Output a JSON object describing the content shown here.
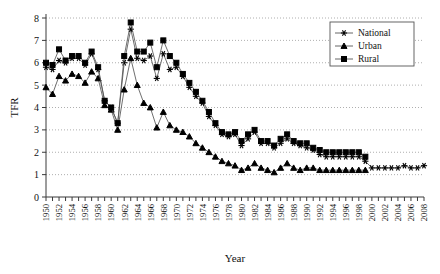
{
  "chart_data": {
    "type": "line",
    "title": "",
    "xlabel": "Year",
    "ylabel": "TFR",
    "xlim": [
      1950,
      2008
    ],
    "ylim": [
      0,
      8
    ],
    "yticks": [
      0,
      1,
      2,
      3,
      4,
      5,
      6,
      7,
      8
    ],
    "xtick_labels": [
      "1950",
      "1952",
      "1954",
      "1956",
      "1958",
      "1960",
      "1962",
      "1964",
      "1966",
      "1968",
      "1970",
      "1972",
      "1974",
      "1976",
      "1978",
      "1980",
      "1982",
      "1984",
      "1986",
      "1988",
      "1990",
      "1992",
      "1994",
      "1996",
      "1998",
      "2000",
      "2002",
      "2004",
      "2006",
      "2008"
    ],
    "xtick_step": 2,
    "grid": "horizontal-dotted",
    "legend_position": "top-right",
    "legend": [
      "National",
      "Urban",
      "Rural"
    ],
    "markers": {
      "National": "asterisk",
      "Urban": "triangle",
      "Rural": "square"
    },
    "series": [
      {
        "name": "National",
        "marker": "asterisk",
        "x": [
          1950,
          1951,
          1952,
          1953,
          1954,
          1955,
          1956,
          1957,
          1958,
          1959,
          1960,
          1961,
          1962,
          1963,
          1964,
          1965,
          1966,
          1967,
          1968,
          1969,
          1970,
          1971,
          1972,
          1973,
          1974,
          1975,
          1976,
          1977,
          1978,
          1979,
          1980,
          1981,
          1982,
          1983,
          1984,
          1985,
          1986,
          1987,
          1988,
          1989,
          1990,
          1991,
          1992,
          1993,
          1994,
          1995,
          1996,
          1997,
          1998,
          1999,
          2000,
          2001,
          2002,
          2003,
          2004,
          2005,
          2006,
          2007,
          2008
        ],
        "values": [
          5.8,
          5.7,
          6.1,
          6.0,
          6.2,
          6.2,
          5.9,
          6.4,
          5.7,
          4.3,
          4.0,
          3.3,
          6.0,
          7.5,
          6.2,
          6.1,
          6.3,
          5.3,
          6.4,
          5.7,
          5.8,
          5.4,
          4.9,
          4.5,
          4.2,
          3.6,
          3.2,
          2.8,
          2.7,
          2.8,
          2.3,
          2.6,
          2.9,
          2.4,
          2.4,
          2.2,
          2.4,
          2.6,
          2.4,
          2.3,
          2.2,
          2.1,
          1.9,
          1.8,
          1.8,
          1.8,
          1.8,
          1.8,
          1.8,
          1.6,
          1.3,
          1.3,
          1.3,
          1.3,
          1.3,
          1.4,
          1.3,
          1.3,
          1.4
        ]
      },
      {
        "name": "Urban",
        "marker": "triangle",
        "x": [
          1950,
          1951,
          1952,
          1953,
          1954,
          1955,
          1956,
          1957,
          1958,
          1959,
          1960,
          1961,
          1962,
          1963,
          1964,
          1965,
          1966,
          1967,
          1968,
          1969,
          1970,
          1971,
          1972,
          1973,
          1974,
          1975,
          1976,
          1977,
          1978,
          1979,
          1980,
          1981,
          1982,
          1983,
          1984,
          1985,
          1986,
          1987,
          1988,
          1989,
          1990,
          1991,
          1992,
          1993,
          1994,
          1995,
          1996,
          1997,
          1998,
          1999
        ],
        "values": [
          4.9,
          4.6,
          5.4,
          5.2,
          5.5,
          5.4,
          5.1,
          5.6,
          5.3,
          4.1,
          3.9,
          3.0,
          4.8,
          6.2,
          5.0,
          4.2,
          4.0,
          3.1,
          3.8,
          3.2,
          3.0,
          2.9,
          2.7,
          2.4,
          2.2,
          2.0,
          1.8,
          1.6,
          1.5,
          1.4,
          1.2,
          1.3,
          1.5,
          1.3,
          1.2,
          1.1,
          1.3,
          1.5,
          1.3,
          1.2,
          1.3,
          1.3,
          1.2,
          1.2,
          1.2,
          1.2,
          1.2,
          1.2,
          1.2,
          1.2
        ]
      },
      {
        "name": "Rural",
        "marker": "square",
        "x": [
          1950,
          1951,
          1952,
          1953,
          1954,
          1955,
          1956,
          1957,
          1958,
          1959,
          1960,
          1961,
          1962,
          1963,
          1964,
          1965,
          1966,
          1967,
          1968,
          1969,
          1970,
          1971,
          1972,
          1973,
          1974,
          1975,
          1976,
          1977,
          1978,
          1979,
          1980,
          1981,
          1982,
          1983,
          1984,
          1985,
          1986,
          1987,
          1988,
          1989,
          1990,
          1991,
          1992,
          1993,
          1994,
          1995,
          1996,
          1997,
          1998,
          1999
        ],
        "values": [
          6.0,
          5.9,
          6.6,
          6.1,
          6.3,
          6.3,
          6.0,
          6.5,
          5.8,
          4.3,
          4.0,
          3.3,
          6.3,
          7.8,
          6.5,
          6.5,
          6.9,
          5.8,
          7.0,
          6.3,
          6.0,
          5.5,
          5.1,
          4.7,
          4.3,
          3.8,
          3.3,
          2.9,
          2.8,
          2.9,
          2.5,
          2.8,
          3.0,
          2.5,
          2.5,
          2.3,
          2.6,
          2.8,
          2.5,
          2.4,
          2.4,
          2.2,
          2.1,
          2.0,
          2.0,
          2.0,
          2.0,
          2.0,
          2.0,
          1.8
        ]
      }
    ]
  }
}
